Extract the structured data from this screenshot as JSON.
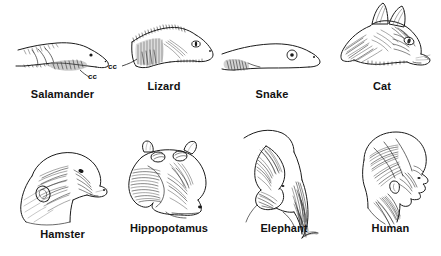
{
  "figure": {
    "background_color": "#ffffff",
    "line_color": "#1b1b1b",
    "label_color": "#111111",
    "columns": 4,
    "rows": 2
  },
  "panels": [
    {
      "id": "salamander",
      "label": "Salamander",
      "row": 1,
      "column": 1,
      "annotation": "cc",
      "annotation_meaning": "cucullaris",
      "has_annotation": true,
      "view": "lateral head and neck",
      "icon": "salamander-head-illustration"
    },
    {
      "id": "lizard",
      "label": "Lizard",
      "row": 1,
      "column": 2,
      "annotation": "cc",
      "annotation_meaning": "cucullaris",
      "has_annotation": true,
      "view": "lateral head and neck",
      "icon": "lizard-head-illustration"
    },
    {
      "id": "snake",
      "label": "Snake",
      "row": 1,
      "column": 3,
      "annotation": "",
      "has_annotation": false,
      "view": "lateral head and neck",
      "icon": "snake-head-illustration"
    },
    {
      "id": "cat",
      "label": "Cat",
      "row": 1,
      "column": 4,
      "annotation": "",
      "has_annotation": false,
      "view": "lateral head and neck",
      "icon": "cat-head-illustration"
    },
    {
      "id": "hamster",
      "label": "Hamster",
      "row": 2,
      "column": 1,
      "annotation": "",
      "has_annotation": false,
      "view": "lateral head and neck",
      "icon": "hamster-head-illustration"
    },
    {
      "id": "hippopotamus",
      "label": "Hippopotamus",
      "row": 2,
      "column": 2,
      "annotation": "",
      "has_annotation": false,
      "view": "lateral head and neck",
      "icon": "hippopotamus-head-illustration"
    },
    {
      "id": "elephant",
      "label": "Elephant",
      "row": 2,
      "column": 3,
      "annotation": "",
      "has_annotation": false,
      "view": "lateral head and neck",
      "icon": "elephant-head-illustration"
    },
    {
      "id": "human",
      "label": "Human",
      "row": 2,
      "column": 4,
      "annotation": "",
      "has_annotation": false,
      "view": "lateral head and neck",
      "icon": "human-head-illustration"
    }
  ]
}
